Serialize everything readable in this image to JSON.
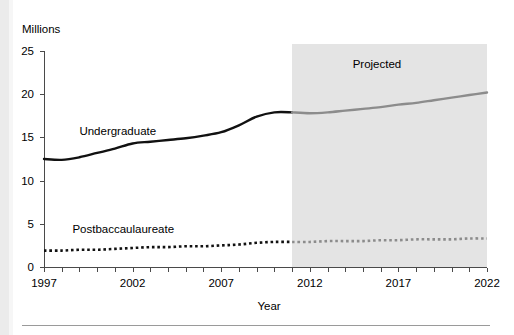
{
  "figure": {
    "y_axis_title": "Millions",
    "x_axis_title": "Year",
    "projected_label": "Projected",
    "series_labels": {
      "undergraduate": "Undergraduate",
      "postbaccalaureate": "Postbaccaulaureate"
    },
    "colors": {
      "actual_line": "#111111",
      "projected_line": "#8c8c8c",
      "projected_band": "#e4e4e4",
      "axis": "#4a4a4a",
      "background": "#ffffff"
    }
  },
  "chart_data": {
    "type": "line",
    "title": "",
    "subtitle": "",
    "xlabel": "Year",
    "ylabel": "Millions",
    "xlim": [
      1997,
      2022
    ],
    "ylim": [
      0,
      25
    ],
    "ytick_values": [
      0,
      5,
      10,
      15,
      20,
      25
    ],
    "ytick_labels": [
      "0",
      "5",
      "10",
      "15",
      "20",
      "25"
    ],
    "xtick_values": [
      1997,
      1998,
      1999,
      2000,
      2001,
      2002,
      2003,
      2004,
      2005,
      2006,
      2007,
      2008,
      2009,
      2010,
      2011,
      2012,
      2013,
      2014,
      2015,
      2016,
      2017,
      2018,
      2019,
      2020,
      2021,
      2022
    ],
    "xtick_labels_shown": [
      "1997",
      "2002",
      "2007",
      "2012",
      "2017",
      "2022"
    ],
    "grid": false,
    "legend": "inline-annotations",
    "projection_start_year": 2011,
    "annotations": [
      {
        "text": "Projected",
        "x": 2016,
        "y": 23.4
      },
      {
        "text": "Undergraduate",
        "x": 1999,
        "y": 15.6
      },
      {
        "text": "Postbaccaulaureate",
        "x": 1998.6,
        "y": 4.3
      }
    ],
    "x": [
      1997,
      1998,
      1999,
      2000,
      2001,
      2002,
      2003,
      2004,
      2005,
      2006,
      2007,
      2008,
      2009,
      2010,
      2011,
      2012,
      2013,
      2014,
      2015,
      2016,
      2017,
      2018,
      2019,
      2020,
      2021,
      2022
    ],
    "series": [
      {
        "name": "Undergraduate",
        "style": "solid",
        "values": [
          12.5,
          12.4,
          12.7,
          13.2,
          13.7,
          14.3,
          14.5,
          14.7,
          14.9,
          15.2,
          15.6,
          16.4,
          17.4,
          17.9,
          17.9,
          17.8,
          17.9,
          18.1,
          18.3,
          18.5,
          18.8,
          19.0,
          19.3,
          19.6,
          19.9,
          20.2
        ]
      },
      {
        "name": "Postbaccaulaureate",
        "style": "dotted",
        "values": [
          1.9,
          1.9,
          2.0,
          2.0,
          2.1,
          2.2,
          2.3,
          2.3,
          2.4,
          2.4,
          2.5,
          2.6,
          2.8,
          2.9,
          2.9,
          2.9,
          3.0,
          3.0,
          3.0,
          3.1,
          3.1,
          3.2,
          3.2,
          3.2,
          3.3,
          3.3
        ]
      }
    ]
  }
}
